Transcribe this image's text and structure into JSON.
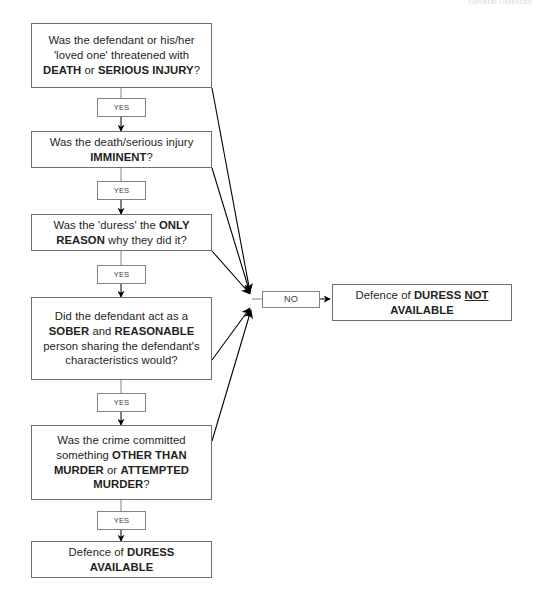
{
  "page": {
    "width": 540,
    "height": 599,
    "background": "#ffffff",
    "border_color": "#6d6e71",
    "connector_border_color": "#808285",
    "text_color": "#231f20",
    "running_head": "General Defences"
  },
  "diagram": {
    "type": "flowchart",
    "yes_label": "YES",
    "no_label": "NO",
    "nodes": [
      {
        "id": "q1",
        "kind": "question",
        "lines": [
          "Was the defendant or his/her",
          "'loved one' threatened with",
          "DEATH or SERIOUS INJURY?"
        ],
        "plain": "Was the defendant or his/her 'loved one' threatened with DEATH or SERIOUS INJURY?"
      },
      {
        "id": "q2",
        "kind": "question",
        "lines": [
          "Was the death/serious injury",
          "IMMINENT?"
        ],
        "plain": "Was the death/serious injury IMMINENT?"
      },
      {
        "id": "q3",
        "kind": "question",
        "lines": [
          "Was the 'duress' the ONLY",
          "REASON why they did it?"
        ],
        "plain": "Was the 'duress' the ONLY REASON why they did it?"
      },
      {
        "id": "q4",
        "kind": "question",
        "lines": [
          "Did the defendant act as a",
          "SOBER and REASONABLE",
          "person sharing the defendant's",
          "characteristics would?"
        ],
        "plain": "Did the defendant act as a SOBER and REASONABLE person sharing the defendant's characteristics would?"
      },
      {
        "id": "q5",
        "kind": "question",
        "lines": [
          "Was the crime committed",
          "something OTHER THAN",
          "MURDER or ATTEMPTED",
          "MURDER?"
        ],
        "plain": "Was the crime committed something OTHER THAN MURDER or ATTEMPTED MURDER?"
      },
      {
        "id": "outcome_available",
        "kind": "outcome",
        "lines": [
          "Defence of DURESS",
          "AVAILABLE"
        ],
        "plain": "Defence of DURESS AVAILABLE"
      },
      {
        "id": "outcome_not_available",
        "kind": "outcome",
        "lines": [
          "Defence of DURESS NOT",
          "AVAILABLE"
        ],
        "plain": "Defence of DURESS NOT AVAILABLE"
      }
    ],
    "edges": [
      {
        "from": "q1",
        "to": "q2",
        "label": "YES"
      },
      {
        "from": "q2",
        "to": "q3",
        "label": "YES"
      },
      {
        "from": "q3",
        "to": "q4",
        "label": "YES"
      },
      {
        "from": "q4",
        "to": "q5",
        "label": "YES"
      },
      {
        "from": "q5",
        "to": "outcome_available",
        "label": "YES"
      },
      {
        "from": "q1",
        "to": "outcome_not_available",
        "label": "NO"
      },
      {
        "from": "q2",
        "to": "outcome_not_available",
        "label": "NO"
      },
      {
        "from": "q3",
        "to": "outcome_not_available",
        "label": "NO"
      },
      {
        "from": "q4",
        "to": "outcome_not_available",
        "label": "NO"
      },
      {
        "from": "q5",
        "to": "outcome_not_available",
        "label": "NO"
      }
    ]
  }
}
